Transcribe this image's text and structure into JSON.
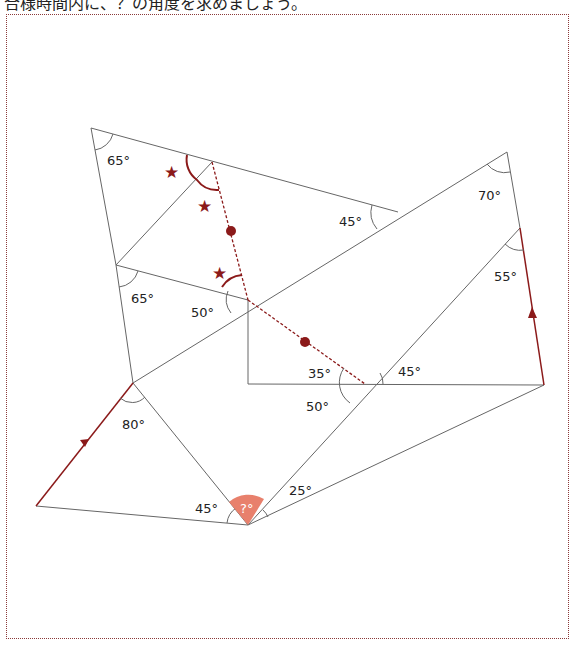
{
  "header": {
    "instruction": "合様時間内に、？の角度を求めましょう。"
  },
  "diagram": {
    "angles": {
      "a65_top": "65°",
      "a65_mid": "65°",
      "a50_mid": "50°",
      "a45_upper": "45°",
      "a70": "70°",
      "a55": "55°",
      "a35": "35°",
      "a45_right": "45°",
      "a50_low": "50°",
      "a80": "80°",
      "a45_bottom": "45°",
      "a25": "25°",
      "unknown": "?°"
    },
    "markers": {
      "star": "★"
    },
    "colors": {
      "line": "#555555",
      "accent": "#8b1a1a",
      "unknown_fill": "#e8806c",
      "frame": "#8b3a3a"
    }
  }
}
